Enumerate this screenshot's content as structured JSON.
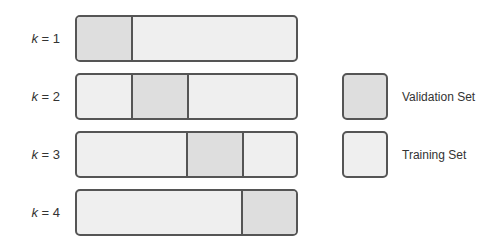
{
  "diagram": {
    "title": "",
    "folds": [
      {
        "label_var": "k",
        "label_rest": " = 1",
        "validation_index": 0
      },
      {
        "label_var": "k",
        "label_rest": " = 2",
        "validation_index": 1
      },
      {
        "label_var": "k",
        "label_rest": " = 3",
        "validation_index": 2
      },
      {
        "label_var": "k",
        "label_rest": " = 4",
        "validation_index": 3
      }
    ],
    "segments_per_bar": 4
  },
  "legend": {
    "items": [
      {
        "label": "Validation Set",
        "color": "#dedede"
      },
      {
        "label": "Training Set",
        "color": "#efefef"
      }
    ]
  },
  "colors": {
    "validation": "#dedede",
    "training": "#efefef",
    "border": "#555555"
  }
}
